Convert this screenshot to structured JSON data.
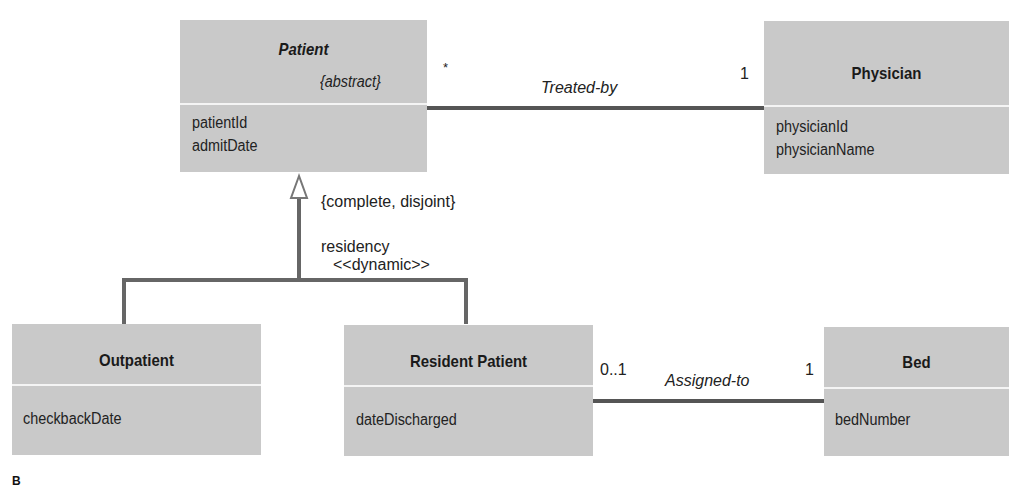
{
  "diagram": {
    "type": "UML class diagram",
    "figure_label": "B",
    "classes": [
      {
        "id": "patient",
        "name": "Patient",
        "stereotype": "{abstract}",
        "abstract": true,
        "attributes": [
          "patientId",
          "admitDate"
        ]
      },
      {
        "id": "physician",
        "name": "Physician",
        "attributes": [
          "physicianId",
          "physicianName"
        ]
      },
      {
        "id": "outpatient",
        "name": "Outpatient",
        "attributes": [
          "checkbackDate"
        ]
      },
      {
        "id": "resident",
        "name": "Resident Patient",
        "attributes": [
          "dateDischarged"
        ]
      },
      {
        "id": "bed",
        "name": "Bed",
        "attributes": [
          "bedNumber"
        ]
      }
    ],
    "associations": [
      {
        "name": "Treated-by",
        "from": "Patient",
        "to": "Physician",
        "from_multiplicity": "*",
        "to_multiplicity": "1"
      },
      {
        "name": "Assigned-to",
        "from": "Resident Patient",
        "to": "Bed",
        "from_multiplicity": "0..1",
        "to_multiplicity": "1"
      }
    ],
    "generalization": {
      "parent": "Patient",
      "children": [
        "Outpatient",
        "Resident Patient"
      ],
      "constraint": "{complete, disjoint}",
      "discriminator": "residency",
      "stereotype": "<<dynamic>>"
    },
    "colors": {
      "box_fill": "#c9c9c9",
      "divider": "#f4f4f4",
      "line": "#555555",
      "text": "#1a1a1a"
    }
  }
}
